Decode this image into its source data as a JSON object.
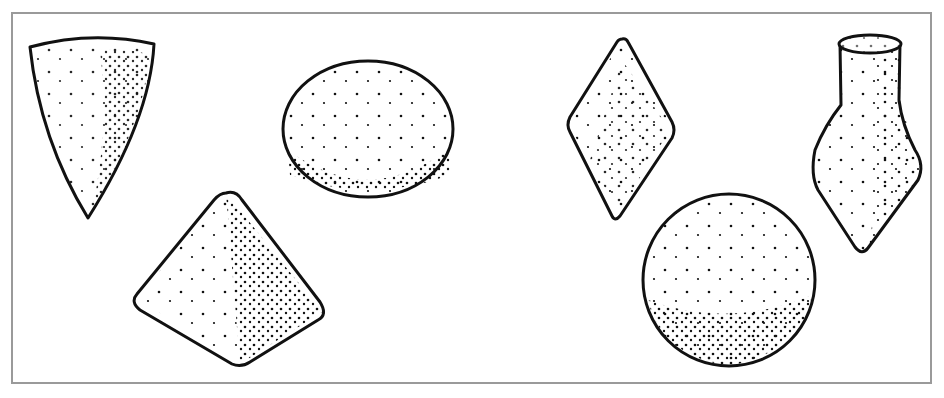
{
  "figure": {
    "frame_color": "#9a9a9a",
    "ink_color": "#111111",
    "background": "#ffffff",
    "shapes": [
      {
        "id": "cone",
        "label": "cone"
      },
      {
        "id": "oval",
        "label": "flattened sphere"
      },
      {
        "id": "pyramid",
        "label": "pyramid"
      },
      {
        "id": "diamond",
        "label": "diamond"
      },
      {
        "id": "sphere",
        "label": "sphere"
      },
      {
        "id": "vase",
        "label": "vase"
      }
    ]
  }
}
